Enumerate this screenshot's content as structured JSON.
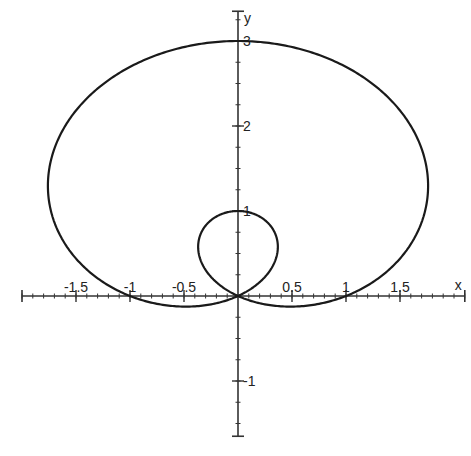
{
  "chart_data": {
    "type": "line",
    "title": "",
    "xlabel": "x",
    "ylabel": "y",
    "equation": "r = 1 + 2 sin(θ)",
    "curve_type": "limaçon with inner loop (polar)",
    "xlim": [
      -2.0,
      2.1
    ],
    "ylim": [
      -1.65,
      3.35
    ],
    "x_ticks": [
      {
        "value": -1.5,
        "label": "-1.5"
      },
      {
        "value": -1,
        "label": "-1"
      },
      {
        "value": -0.5,
        "label": "-0.5"
      },
      {
        "value": 0.5,
        "label": "0.5"
      },
      {
        "value": 1,
        "label": "1"
      },
      {
        "value": 1.5,
        "label": "1.5"
      }
    ],
    "y_ticks": [
      {
        "value": -1,
        "label": "-1"
      },
      {
        "value": 1,
        "label": "1"
      },
      {
        "value": 2,
        "label": "2"
      },
      {
        "value": 3,
        "label": "3"
      }
    ],
    "minor_tick_step": 0.1,
    "grid": false,
    "legend": "none",
    "key_points": [
      {
        "x": 0,
        "y": 3,
        "note": "outer loop top"
      },
      {
        "x": 0,
        "y": 1,
        "note": "inner loop top"
      },
      {
        "x": 0,
        "y": 0,
        "note": "pole / self-intersection"
      },
      {
        "x": -1,
        "y": 0,
        "note": "x-axis crossing"
      },
      {
        "x": 1,
        "y": 0,
        "note": "x-axis crossing"
      },
      {
        "x": -1.76,
        "y": 1.5,
        "note": "leftmost"
      },
      {
        "x": 1.76,
        "y": 1.5,
        "note": "rightmost"
      },
      {
        "x": -0.5,
        "y": -0.13,
        "note": "bottom of lower lobe"
      },
      {
        "x": 0.5,
        "y": -0.13,
        "note": "bottom of lower lobe"
      }
    ],
    "pixel_mapping": {
      "origin_px": [
        238,
        296
      ],
      "x_px_per_unit": 108,
      "y_px_per_unit": 85
    },
    "style": {
      "line_color": "#1a1a1a",
      "axis_color": "#333333",
      "background": "#ffffff"
    }
  }
}
